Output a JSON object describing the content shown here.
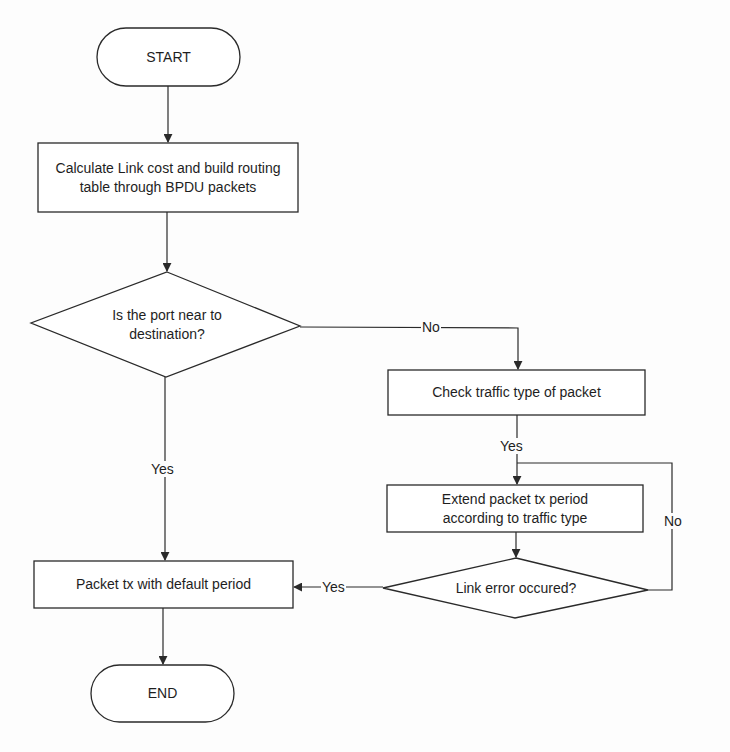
{
  "diagram": {
    "type": "flowchart",
    "nodes": {
      "start": {
        "label": "START",
        "shape": "terminator"
      },
      "calc": {
        "label": "Calculate Link cost and build routing table through BPDU packets",
        "shape": "process"
      },
      "near": {
        "label": "Is the port near to destination?",
        "shape": "decision"
      },
      "check": {
        "label": "Check traffic type of packet",
        "shape": "process"
      },
      "extend": {
        "label": "Extend packet tx period according to traffic type",
        "shape": "process"
      },
      "linkerr": {
        "label": "Link error occured?",
        "shape": "decision"
      },
      "default": {
        "label": "Packet tx with default period",
        "shape": "process"
      },
      "end": {
        "label": "END",
        "shape": "terminator"
      }
    },
    "edges": [
      {
        "from": "start",
        "to": "calc",
        "label": ""
      },
      {
        "from": "calc",
        "to": "near",
        "label": ""
      },
      {
        "from": "near",
        "to": "check",
        "label": "No"
      },
      {
        "from": "near",
        "to": "default",
        "label": "Yes"
      },
      {
        "from": "check",
        "to": "extend",
        "label": "Yes"
      },
      {
        "from": "extend",
        "to": "linkerr",
        "label": ""
      },
      {
        "from": "linkerr",
        "to": "extend",
        "label": "No"
      },
      {
        "from": "linkerr",
        "to": "default",
        "label": "Yes"
      },
      {
        "from": "default",
        "to": "end",
        "label": ""
      }
    ],
    "edge_labels": {
      "near_no": "No",
      "near_yes": "Yes",
      "check_yes": "Yes",
      "linkerr_no": "No",
      "linkerr_yes": "Yes"
    },
    "colors": {
      "stroke": "#2a2a2a",
      "fill": "#ffffff",
      "text": "#1e1e1e",
      "background": "#fdfdfd"
    }
  }
}
